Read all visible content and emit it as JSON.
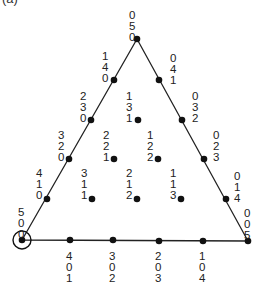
{
  "panel_label": "(a)",
  "triangle": {
    "vertices": [
      [
        137,
        39
      ],
      [
        22,
        240
      ],
      [
        248,
        241
      ]
    ],
    "stroke": "#222222"
  },
  "highlight_circle": {
    "cx": 22,
    "cy": 240,
    "r": 9
  },
  "points": [
    {
      "label": "050",
      "x": 137,
      "y": 39,
      "lx": 129,
      "ly": 9,
      "side": "left"
    },
    {
      "label": "140",
      "x": 114,
      "y": 80,
      "lx": 102,
      "ly": 50,
      "side": "left"
    },
    {
      "label": "041",
      "x": 159,
      "y": 80,
      "lx": 170,
      "ly": 52,
      "side": "right"
    },
    {
      "label": "230",
      "x": 91,
      "y": 120,
      "lx": 80,
      "ly": 90,
      "side": "left"
    },
    {
      "label": "131",
      "x": 138,
      "y": 120,
      "lx": 126,
      "ly": 90,
      "side": "left"
    },
    {
      "label": "032",
      "x": 182,
      "y": 120,
      "lx": 192,
      "ly": 90,
      "side": "right"
    },
    {
      "label": "320",
      "x": 69,
      "y": 159,
      "lx": 58,
      "ly": 129,
      "side": "left"
    },
    {
      "label": "221",
      "x": 114,
      "y": 159,
      "lx": 103,
      "ly": 129,
      "side": "left"
    },
    {
      "label": "122",
      "x": 158,
      "y": 159,
      "lx": 147,
      "ly": 129,
      "side": "left"
    },
    {
      "label": "023",
      "x": 204,
      "y": 159,
      "lx": 213,
      "ly": 129,
      "side": "right"
    },
    {
      "label": "410",
      "x": 47,
      "y": 199,
      "lx": 36,
      "ly": 167,
      "side": "left"
    },
    {
      "label": "311",
      "x": 92,
      "y": 199,
      "lx": 81,
      "ly": 167,
      "side": "left"
    },
    {
      "label": "212",
      "x": 137,
      "y": 199,
      "lx": 126,
      "ly": 167,
      "side": "left"
    },
    {
      "label": "113",
      "x": 181,
      "y": 199,
      "lx": 170,
      "ly": 167,
      "side": "left"
    },
    {
      "label": "014",
      "x": 226,
      "y": 199,
      "lx": 234,
      "ly": 170,
      "side": "right"
    },
    {
      "label": "500",
      "x": 22,
      "y": 240,
      "lx": 18,
      "ly": 206,
      "side": "left"
    },
    {
      "label": "401",
      "x": 70,
      "y": 240,
      "lx": 66,
      "ly": 250,
      "side": "below"
    },
    {
      "label": "302",
      "x": 113,
      "y": 240,
      "lx": 109,
      "ly": 250,
      "side": "below"
    },
    {
      "label": "203",
      "x": 159,
      "y": 241,
      "lx": 155,
      "ly": 250,
      "side": "below"
    },
    {
      "label": "104",
      "x": 203,
      "y": 241,
      "lx": 199,
      "ly": 250,
      "side": "below"
    },
    {
      "label": "005",
      "x": 248,
      "y": 241,
      "lx": 244,
      "ly": 207,
      "side": "right"
    }
  ]
}
